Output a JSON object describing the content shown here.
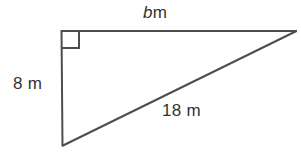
{
  "figure": {
    "background_color": "#ffffff",
    "stroke_color": "#4d4d4d",
    "text_color": "#333333",
    "labels": {
      "top_side": {
        "variable": "b",
        "unit": "m",
        "full": "b m"
      },
      "left_side": {
        "value": "8",
        "unit": "m",
        "full": "8 m"
      },
      "hypotenuse": {
        "value": "18",
        "unit": "m",
        "full": "18 m"
      }
    },
    "right_angle": {
      "present": true,
      "vertex": "top-left",
      "marker": "square"
    },
    "geometry": {
      "vertices": {
        "top_left": [
          61,
          31
        ],
        "top_right": [
          296,
          31
        ],
        "bottom_left": [
          62,
          146
        ]
      },
      "stroke_width": 2
    }
  }
}
